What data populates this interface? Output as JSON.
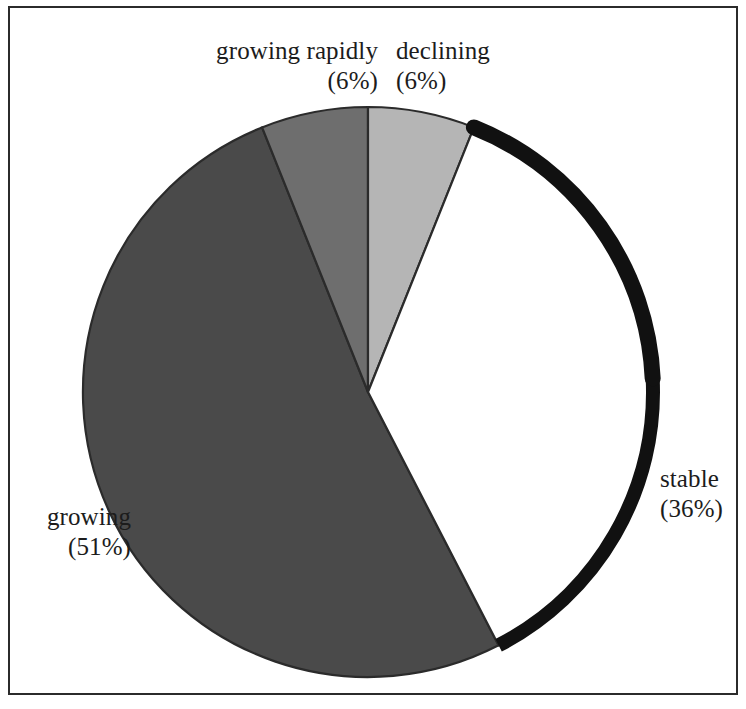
{
  "figure": {
    "title": "",
    "frame_color": "#2b2b2b",
    "background": "#ffffff"
  },
  "chart_data": {
    "type": "pie",
    "title": "",
    "xlabel": "",
    "ylabel": "",
    "grid": false,
    "legend_position": "none",
    "label_format": "name newline (percent%)",
    "start_angle_deg": 0,
    "direction": "clockwise",
    "center_px": [
      368,
      392
    ],
    "radius_px": 285,
    "categories": [
      "declining",
      "stable",
      "growing",
      "growing rapidly"
    ],
    "values": [
      6,
      36,
      51,
      6
    ],
    "units": "percent",
    "slices": [
      {
        "name": "declining",
        "percent": 6,
        "label": "declining",
        "percent_label": "(6%)",
        "color": "#b5b5b5",
        "edge_color": "#2b2b2b",
        "start_angle_deg": 0,
        "end_angle_deg": 21.6,
        "emphasis": false
      },
      {
        "name": "stable",
        "percent": 36,
        "label": "stable",
        "percent_label": "(36%)",
        "color": "#ffffff",
        "edge_color": "#2b2b2b",
        "start_angle_deg": 21.6,
        "end_angle_deg": 151.2,
        "emphasis": true,
        "emphasis_arc_color": "#111111",
        "emphasis_arc_width_px": 14
      },
      {
        "name": "growing",
        "percent": 51,
        "label": "growing",
        "percent_label": "(51%)",
        "color": "#4a4a4a",
        "edge_color": "#2b2b2b",
        "start_angle_deg": 151.2,
        "end_angle_deg": 334.8,
        "emphasis": false
      },
      {
        "name": "growing rapidly",
        "percent": 6,
        "label": "growing rapidly",
        "percent_label": "(6%)",
        "color": "#6e6e6e",
        "edge_color": "#2b2b2b",
        "start_angle_deg": 334.8,
        "end_angle_deg": 360,
        "emphasis": false
      }
    ]
  }
}
